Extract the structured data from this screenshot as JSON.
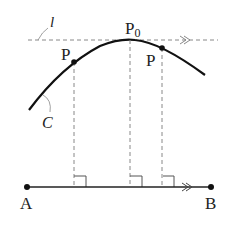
{
  "diagram": {
    "labels": {
      "line_l": "l",
      "curve_c": "C",
      "p0": "P",
      "p0_sub": "0",
      "p_left": "P",
      "p_right": "P",
      "a": "A",
      "b": "B"
    },
    "arrow_marks": {
      "top": "≫",
      "bottom": "≫"
    },
    "colors": {
      "stroke": "#222222",
      "dashed": "#777777"
    }
  }
}
